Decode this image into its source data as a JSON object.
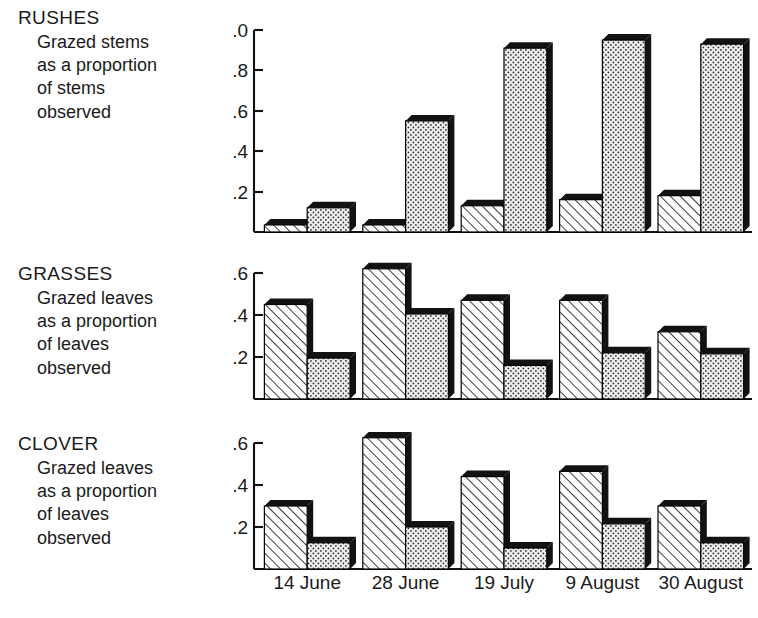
{
  "figure": {
    "panels": [
      {
        "id": "rushes",
        "title": "RUSHES",
        "sub_lines": [
          "Grazed stems",
          "as a proportion",
          "of stems",
          "observed"
        ]
      },
      {
        "id": "grasses",
        "title": "GRASSES",
        "sub_lines": [
          "Grazed leaves",
          "as a proportion",
          "of leaves",
          "observed"
        ]
      },
      {
        "id": "clover",
        "title": "CLOVER",
        "sub_lines": [
          "Grazed leaves",
          "as a proportion",
          "of leaves",
          "observed"
        ]
      }
    ],
    "x_categories": [
      "14 June",
      "28 June",
      "19 July",
      "9 August",
      "30 August"
    ]
  },
  "chart_data": [
    {
      "type": "bar",
      "id": "rushes",
      "title": "RUSHES",
      "subtitle": "Grazed stems as a proportion of stems observed",
      "xlabel": "",
      "ylabel": "",
      "ylim": [
        0,
        1.0
      ],
      "yticks": [
        0.2,
        0.4,
        0.6,
        0.8,
        1.0
      ],
      "ytick_labels": [
        "0.2",
        "0.4",
        "0.6",
        "0.8",
        "1.0"
      ],
      "grid": false,
      "legend": false,
      "categories": [
        "14 June",
        "28 June",
        "19 July",
        "9 August",
        "30 August"
      ],
      "series": [
        {
          "name": "hatched",
          "pattern": "diagonal-hatch",
          "values": [
            0.035,
            0.035,
            0.13,
            0.16,
            0.18
          ]
        },
        {
          "name": "dotted",
          "pattern": "stipple-dot",
          "values": [
            0.12,
            0.55,
            0.91,
            0.95,
            0.93
          ]
        }
      ]
    },
    {
      "type": "bar",
      "id": "grasses",
      "title": "GRASSES",
      "subtitle": "Grazed leaves as a proportion of leaves observed",
      "xlabel": "",
      "ylabel": "",
      "ylim": [
        0,
        0.66
      ],
      "yticks": [
        0.2,
        0.4,
        0.6
      ],
      "ytick_labels": [
        "0.2",
        "0.4",
        "0.6"
      ],
      "grid": false,
      "legend": false,
      "categories": [
        "14 June",
        "28 June",
        "19 July",
        "9 August",
        "30 August"
      ],
      "series": [
        {
          "name": "hatched",
          "pattern": "diagonal-hatch",
          "values": [
            0.45,
            0.62,
            0.47,
            0.47,
            0.32
          ]
        },
        {
          "name": "dotted",
          "pattern": "stipple-dot",
          "values": [
            0.195,
            0.405,
            0.16,
            0.22,
            0.215
          ]
        }
      ]
    },
    {
      "type": "bar",
      "id": "clover",
      "title": "CLOVER",
      "subtitle": "Grazed leaves as a proportion of leaves observed",
      "xlabel": "",
      "ylabel": "",
      "ylim": [
        0,
        0.66
      ],
      "yticks": [
        0.2,
        0.4,
        0.6
      ],
      "ytick_labels": [
        "0.2",
        "0.4",
        "0.6"
      ],
      "grid": false,
      "legend": false,
      "categories": [
        "14 June",
        "28 June",
        "19 July",
        "9 August",
        "30 August"
      ],
      "series": [
        {
          "name": "hatched",
          "pattern": "diagonal-hatch",
          "values": [
            0.3,
            0.625,
            0.44,
            0.465,
            0.3
          ]
        },
        {
          "name": "dotted",
          "pattern": "stipple-dot",
          "values": [
            0.125,
            0.2,
            0.1,
            0.215,
            0.125
          ]
        }
      ]
    }
  ]
}
